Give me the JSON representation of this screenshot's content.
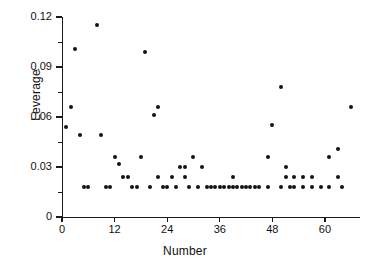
{
  "chart_data": {
    "type": "scatter",
    "title": "",
    "xlabel": "Number",
    "ylabel": "Leverage",
    "xlim": [
      0,
      68
    ],
    "ylim": [
      0,
      0.12
    ],
    "grid": false,
    "legend": "none",
    "marker": "filled-circle",
    "marker_color": "#121212",
    "xticks": [
      0,
      12,
      24,
      36,
      48,
      60
    ],
    "xtick_labels": [
      "0",
      "12",
      "24",
      "36",
      "48",
      "60"
    ],
    "yticks": [
      0,
      0.03,
      0.06,
      0.09,
      0.12
    ],
    "ytick_labels": [
      "0",
      "0.03",
      "0.06",
      "0.09",
      "0.12"
    ],
    "y_minor_ticks": [
      0.015,
      0.045,
      0.075,
      0.105
    ],
    "points": [
      {
        "x": 1,
        "y": 0.054
      },
      {
        "x": 2,
        "y": 0.066
      },
      {
        "x": 3,
        "y": 0.101
      },
      {
        "x": 4,
        "y": 0.049
      },
      {
        "x": 5,
        "y": 0.018
      },
      {
        "x": 6,
        "y": 0.018
      },
      {
        "x": 8,
        "y": 0.115
      },
      {
        "x": 9,
        "y": 0.049
      },
      {
        "x": 10,
        "y": 0.018
      },
      {
        "x": 11,
        "y": 0.018
      },
      {
        "x": 12,
        "y": 0.036
      },
      {
        "x": 13,
        "y": 0.032
      },
      {
        "x": 14,
        "y": 0.024
      },
      {
        "x": 15,
        "y": 0.024
      },
      {
        "x": 16,
        "y": 0.018
      },
      {
        "x": 17,
        "y": 0.018
      },
      {
        "x": 18,
        "y": 0.036
      },
      {
        "x": 19,
        "y": 0.099
      },
      {
        "x": 20,
        "y": 0.018
      },
      {
        "x": 21,
        "y": 0.061
      },
      {
        "x": 22,
        "y": 0.066
      },
      {
        "x": 22,
        "y": 0.024
      },
      {
        "x": 23,
        "y": 0.018
      },
      {
        "x": 24,
        "y": 0.018
      },
      {
        "x": 25,
        "y": 0.024
      },
      {
        "x": 26,
        "y": 0.018
      },
      {
        "x": 27,
        "y": 0.03
      },
      {
        "x": 28,
        "y": 0.024
      },
      {
        "x": 28,
        "y": 0.03
      },
      {
        "x": 29,
        "y": 0.018
      },
      {
        "x": 30,
        "y": 0.036
      },
      {
        "x": 31,
        "y": 0.018
      },
      {
        "x": 32,
        "y": 0.03
      },
      {
        "x": 33,
        "y": 0.018
      },
      {
        "x": 34,
        "y": 0.018
      },
      {
        "x": 35,
        "y": 0.018
      },
      {
        "x": 36,
        "y": 0.018
      },
      {
        "x": 37,
        "y": 0.018
      },
      {
        "x": 38,
        "y": 0.018
      },
      {
        "x": 39,
        "y": 0.024
      },
      {
        "x": 39,
        "y": 0.018
      },
      {
        "x": 40,
        "y": 0.018
      },
      {
        "x": 41,
        "y": 0.018
      },
      {
        "x": 42,
        "y": 0.018
      },
      {
        "x": 43,
        "y": 0.018
      },
      {
        "x": 44,
        "y": 0.018
      },
      {
        "x": 45,
        "y": 0.018
      },
      {
        "x": 47,
        "y": 0.036
      },
      {
        "x": 47,
        "y": 0.018
      },
      {
        "x": 48,
        "y": 0.055
      },
      {
        "x": 50,
        "y": 0.078
      },
      {
        "x": 50,
        "y": 0.018
      },
      {
        "x": 51,
        "y": 0.03
      },
      {
        "x": 51,
        "y": 0.024
      },
      {
        "x": 52,
        "y": 0.018
      },
      {
        "x": 53,
        "y": 0.024
      },
      {
        "x": 53,
        "y": 0.018
      },
      {
        "x": 55,
        "y": 0.024
      },
      {
        "x": 55,
        "y": 0.018
      },
      {
        "x": 57,
        "y": 0.024
      },
      {
        "x": 57,
        "y": 0.018
      },
      {
        "x": 59,
        "y": 0.018
      },
      {
        "x": 61,
        "y": 0.036
      },
      {
        "x": 61,
        "y": 0.018
      },
      {
        "x": 63,
        "y": 0.041
      },
      {
        "x": 63,
        "y": 0.024
      },
      {
        "x": 64,
        "y": 0.018
      },
      {
        "x": 66,
        "y": 0.066
      }
    ]
  }
}
